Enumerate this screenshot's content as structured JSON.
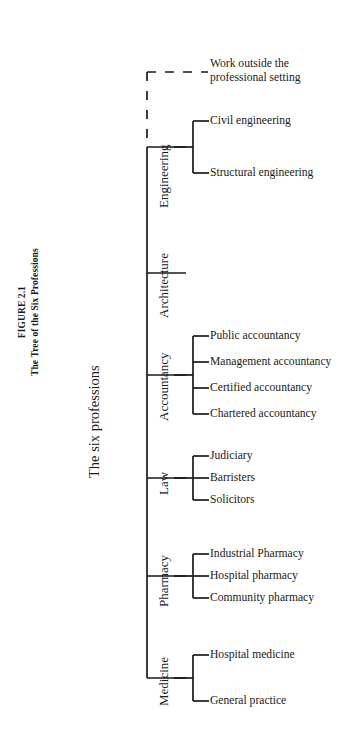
{
  "figure": {
    "caption_line1": "FIGURE 2.1",
    "caption_line2": "The Tree of the Six Professions",
    "root_label": "The six professions",
    "outside_note_line1": "Work outside the",
    "outside_note_line2": "professional setting",
    "line_color": "#1a1a1a",
    "background_color": "#ffffff"
  },
  "branches": [
    {
      "label": "Engineering",
      "leaves": [
        "Civil engineering",
        "Structural engineering"
      ]
    },
    {
      "label": "Architecture",
      "leaves": []
    },
    {
      "label": "Accountancy",
      "leaves": [
        "Public accountancy",
        "Management accountancy",
        "Certified accountancy",
        "Chartered accountancy"
      ]
    },
    {
      "label": "Law",
      "leaves": [
        "Judiciary",
        "Barristers",
        "Solicitors"
      ]
    },
    {
      "label": "Pharmacy",
      "leaves": [
        "Industrial Pharmacy",
        "Hospital pharmacy",
        "Community pharmacy"
      ]
    },
    {
      "label": "Medicine",
      "leaves": [
        "Hospital medicine",
        "General practice"
      ]
    }
  ]
}
